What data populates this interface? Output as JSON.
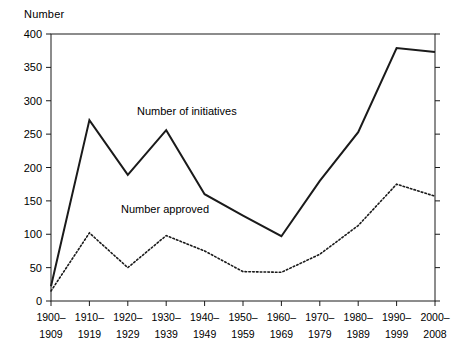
{
  "chart_data": {
    "type": "line",
    "title": "",
    "xlabel": "",
    "ylabel": "Number",
    "ylim": [
      0,
      400
    ],
    "yticks": [
      0,
      50,
      100,
      150,
      200,
      250,
      300,
      350,
      400
    ],
    "grid": false,
    "legend_position": "inline-annotation",
    "categories": [
      "1900–\n1909",
      "1910–\n1919",
      "1920–\n1929",
      "1930–\n1939",
      "1940–\n1949",
      "1950–\n1959",
      "1960–\n1969",
      "1970–\n1979",
      "1980–\n1989",
      "1990–\n1999",
      "2000–\n2008"
    ],
    "category_lines": [
      [
        "1900–",
        "1909"
      ],
      [
        "1910–",
        "1919"
      ],
      [
        "1920–",
        "1929"
      ],
      [
        "1930–",
        "1939"
      ],
      [
        "1940–",
        "1949"
      ],
      [
        "1950–",
        "1959"
      ],
      [
        "1960–",
        "1969"
      ],
      [
        "1970–",
        "1979"
      ],
      [
        "1980–",
        "1989"
      ],
      [
        "1990–",
        "1999"
      ],
      [
        "2000–",
        "2008"
      ]
    ],
    "series": [
      {
        "name": "Number of initiatives",
        "style": "solid",
        "color": "#1a1a1a",
        "values": [
          22,
          271,
          189,
          256,
          160,
          128,
          97,
          180,
          253,
          379,
          373
        ]
      },
      {
        "name": "Number approved",
        "style": "dotted",
        "color": "#1a1a1a",
        "values": [
          15,
          102,
          50,
          98,
          75,
          44,
          43,
          70,
          113,
          175,
          157
        ]
      }
    ],
    "annotations": [
      {
        "text": "Number of initiatives",
        "x_px": 137,
        "y_px": 115
      },
      {
        "text": "Number approved",
        "x_px": 121,
        "y_px": 213
      }
    ]
  }
}
